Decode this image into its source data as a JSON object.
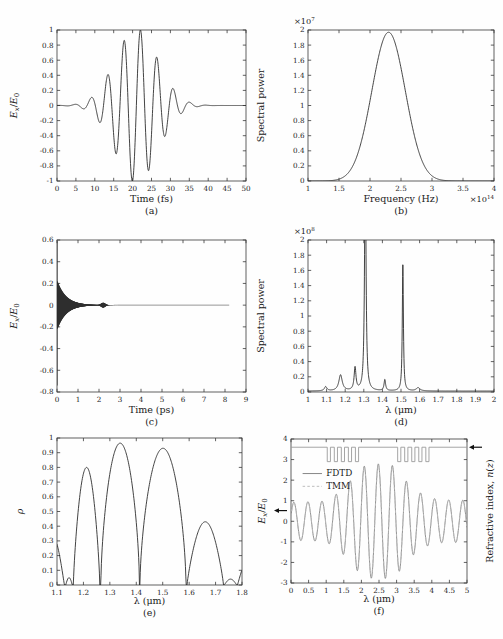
{
  "figure": {
    "background": "#fefefe"
  },
  "style": {
    "frame_color": "#3a3a3a",
    "text_color": "#1a1a1a",
    "curve_color": "#2e2e2e",
    "fdtd_color": "#878787",
    "tmm_color": "#bcbcbc",
    "index_color": "#9b9b9b",
    "arrow_color": "#111111"
  },
  "chart_data": [
    {
      "id": "a",
      "type": "line",
      "caption": "(a)",
      "xlabel": "Time (fs)",
      "ylabel_rich": [
        {
          "t": "E",
          "i": true
        },
        {
          "t": "x",
          "i": true,
          "sub": true
        },
        {
          "t": "/"
        },
        {
          "t": "E",
          "i": true
        },
        {
          "t": "0",
          "sub": true
        }
      ],
      "xlim": [
        0,
        50
      ],
      "ylim": [
        -1,
        1
      ],
      "xticks": [
        0,
        5,
        10,
        15,
        20,
        25,
        30,
        35,
        40,
        45,
        50
      ],
      "xtick_labels": [
        "0",
        "5",
        "10",
        "15",
        "20",
        "25",
        "30",
        "35",
        "40",
        "45",
        "50"
      ],
      "yticks": [
        -1,
        -0.8,
        -0.6,
        -0.4,
        -0.2,
        0,
        0.2,
        0.4,
        0.6,
        0.8,
        1
      ],
      "ytick_labels": [
        "-1",
        "-0.8",
        "-0.6",
        "-0.4",
        "-0.2",
        "0",
        "0.2",
        "0.4",
        "0.6",
        "0.8",
        "1"
      ],
      "layout": {
        "ml": 57,
        "mr": 5,
        "mt": 30,
        "ph": 151,
        "ylabel_dx": -40,
        "xlabel_dy": 21,
        "caption_dy": 33
      },
      "series": [
        {
          "name": "pulse",
          "model": "gabor",
          "amp": 1.02,
          "center": 21,
          "sigma": 5.6,
          "freq": 0.23,
          "phase": 0,
          "range": [
            0,
            50
          ],
          "step": 0.05,
          "color": "curve_color",
          "width": 0.9
        }
      ],
      "notable_points": {
        "max": {
          "t_fs": 22,
          "value": 0.98
        },
        "min": {
          "t_fs": 20,
          "value": -1.0
        },
        "pulse_center_fs": 21
      }
    },
    {
      "id": "b",
      "type": "line",
      "caption": "(b)",
      "xlabel": "Frequency (Hz)",
      "ylabel": "Spectral power",
      "y_exp_label": {
        "base": "×10",
        "exp": "7"
      },
      "x_exp_label": {
        "base": "×10",
        "exp": "14"
      },
      "xlim": [
        1,
        4
      ],
      "ylim": [
        0,
        2
      ],
      "xticks": [
        1,
        1.5,
        2,
        2.5,
        3,
        3.5,
        4
      ],
      "xtick_labels": [
        "1",
        "1.5",
        "2",
        "2.5",
        "3",
        "3.5",
        "4"
      ],
      "yticks": [
        0,
        0.2,
        0.4,
        0.6,
        0.8,
        1,
        1.2,
        1.4,
        1.6,
        1.8,
        2
      ],
      "ytick_labels": [
        "0",
        "0.2",
        "0.4",
        "0.6",
        "0.8",
        "1",
        "1.2",
        "1.4",
        "1.6",
        "1.8",
        "2"
      ],
      "layout": {
        "ml": 57,
        "mr": 9,
        "mt": 30,
        "ph": 151,
        "ylabel_dx": -44,
        "xlabel_dy": 21,
        "caption_dy": 33
      },
      "series": [
        {
          "name": "spectrum",
          "model": "gaussian",
          "amp": 1.97,
          "center": 2.3,
          "sigma": 0.27,
          "range": [
            1,
            4
          ],
          "step": 0.005,
          "color": "curve_color",
          "width": 0.9
        }
      ],
      "notable_points": {
        "peak": {
          "frequency_e14_Hz": 2.3,
          "spectral_power_e7": 1.97
        }
      }
    },
    {
      "id": "c",
      "type": "line",
      "caption": "(c)",
      "xlabel": "Time (ps)",
      "ylabel_rich": [
        {
          "t": "E",
          "i": true
        },
        {
          "t": "x",
          "i": true,
          "sub": true
        },
        {
          "t": "/"
        },
        {
          "t": "E",
          "i": true
        },
        {
          "t": "0",
          "sub": true
        }
      ],
      "xlim": [
        0,
        9
      ],
      "ylim": [
        -0.8,
        0.6
      ],
      "xticks": [
        0,
        1,
        2,
        3,
        4,
        5,
        6,
        7,
        8,
        9
      ],
      "xtick_labels": [
        "0",
        "1",
        "2",
        "3",
        "4",
        "5",
        "6",
        "7",
        "8",
        "9"
      ],
      "yticks": [
        -0.8,
        -0.6,
        -0.4,
        -0.2,
        0,
        0.2,
        0.4,
        0.6
      ],
      "ytick_labels": [
        "-0.8",
        "-0.6",
        "-0.4",
        "-0.2",
        "0",
        "0.2",
        "0.4",
        "0.6"
      ],
      "layout": {
        "ml": 57,
        "mr": 5,
        "mt": 27,
        "ph": 152,
        "ylabel_dx": -40,
        "xlabel_dy": 21,
        "caption_dy": 33
      },
      "series": [
        {
          "name": "ringdown",
          "model": "decay_band",
          "intro": [
            [
              0,
              0
            ],
            [
              0.004,
              0.59
            ],
            [
              0.007,
              -0.74
            ]
          ],
          "t0": 0.01,
          "t1": 2.9,
          "dt": 0.004,
          "amp": 0.225,
          "tau": 0.42,
          "bump": {
            "t": 2.2,
            "a": 0.02,
            "w": 0.13
          },
          "flat_to": 8.2,
          "color": "curve_color",
          "width": 0.5
        }
      ],
      "notable_points": {
        "initial_spike_max": 0.59,
        "initial_spike_min": -0.74,
        "envelope_at_0.1ps": 0.2,
        "decayed_by_ps": 2.6,
        "trace_end_ps": 8.2
      }
    },
    {
      "id": "d",
      "type": "line",
      "caption": "(d)",
      "xlabel": "λ (μm)",
      "ylabel": "Spectral power",
      "y_exp_label": {
        "base": "×10",
        "exp": "8"
      },
      "xlim": [
        1,
        2
      ],
      "ylim": [
        0,
        2
      ],
      "xticks": [
        1,
        1.1,
        1.2,
        1.3,
        1.4,
        1.5,
        1.6,
        1.7,
        1.8,
        1.9,
        2
      ],
      "xtick_labels": [
        "1",
        "1.1",
        "1.2",
        "1.3",
        "1.4",
        "1.5",
        "1.6",
        "1.7",
        "1.8",
        "1.9",
        "2"
      ],
      "yticks": [
        0,
        0.2,
        0.4,
        0.6,
        0.8,
        1,
        1.2,
        1.4,
        1.6,
        1.8,
        2
      ],
      "ytick_labels": [
        "0",
        "0.2",
        "0.4",
        "0.6",
        "0.8",
        "1",
        "1.2",
        "1.4",
        "1.6",
        "1.8",
        "2"
      ],
      "layout": {
        "ml": 57,
        "mr": 9,
        "mt": 27,
        "ph": 152,
        "ylabel_dx": -44,
        "xlabel_dy": 21,
        "caption_dy": 33
      },
      "series": [
        {
          "name": "spectrum",
          "model": "lorentz_peaks",
          "base": 0.012,
          "range": [
            1,
            2
          ],
          "step": 0.0008,
          "peaks": [
            [
              1.095,
              0.055,
              0.008
            ],
            [
              1.175,
              0.21,
              0.011
            ],
            [
              1.253,
              0.3,
              0.006
            ],
            [
              1.308,
              3.2,
              0.0045
            ],
            [
              1.413,
              0.145,
              0.005
            ],
            [
              1.51,
              1.68,
              0.0035
            ],
            [
              1.592,
              0.042,
              0.012
            ]
          ],
          "color": "curve_color",
          "width": 0.9
        }
      ],
      "notable_points": {
        "main_peak": {
          "lambda_um": 1.31,
          "clipped_at_e8": 2.0
        },
        "second_peak": {
          "lambda_um": 1.51,
          "value_e8": 1.68
        },
        "minor_peaks_um": [
          1.1,
          1.18,
          1.25,
          1.41,
          1.59
        ]
      }
    },
    {
      "id": "e",
      "type": "line",
      "caption": "(e)",
      "xlabel": "λ (μm)",
      "ylabel_rich": [
        {
          "t": "ρ",
          "i": true
        }
      ],
      "xlim": [
        1.1,
        1.8
      ],
      "ylim": [
        0,
        1
      ],
      "xticks": [
        1.1,
        1.2,
        1.3,
        1.4,
        1.5,
        1.6,
        1.7,
        1.8
      ],
      "xtick_labels": [
        "1.1",
        "1.2",
        "1.3",
        "1.4",
        "1.5",
        "1.6",
        "1.7",
        "1.8"
      ],
      "yticks": [
        0,
        0.1,
        0.2,
        0.3,
        0.4,
        0.5,
        0.6,
        0.7,
        0.8,
        0.9,
        1
      ],
      "ytick_labels": [
        "0",
        "0.1",
        "0.2",
        "0.3",
        "0.4",
        "0.5",
        "0.6",
        "0.7",
        "0.8",
        "0.9",
        "1"
      ],
      "layout": {
        "ml": 57,
        "mr": 9,
        "mt": 12,
        "ph": 147,
        "ylabel_dx": -34,
        "xlabel_dy": 19,
        "caption_dy": 31
      },
      "series": [
        {
          "name": "reflectance",
          "model": "lobes",
          "range": [
            1.1,
            1.8
          ],
          "step": 0.0015,
          "lobes": [
            [
              1.04,
              1.128,
              0.33,
              1
            ],
            [
              1.133,
              1.158,
              0.05,
              1
            ],
            [
              1.162,
              1.262,
              0.8,
              0.75
            ],
            [
              1.266,
              1.412,
              0.965,
              0.6
            ],
            [
              1.414,
              1.588,
              0.93,
              0.6
            ],
            [
              1.592,
              1.73,
              0.43,
              0.85
            ],
            [
              1.733,
              1.78,
              0.04,
              1
            ],
            [
              1.783,
              1.87,
              0.18,
              1
            ]
          ],
          "color": "curve_color",
          "width": 0.9
        }
      ],
      "notable_points": {
        "lobe_peaks": [
          {
            "lambda_um": 1.22,
            "rho": 0.8
          },
          {
            "lambda_um": 1.34,
            "rho": 0.965
          },
          {
            "lambda_um": 1.48,
            "rho": 0.93
          },
          {
            "lambda_um": 1.64,
            "rho": 0.43
          }
        ],
        "zeros_um": [
          1.13,
          1.16,
          1.26,
          1.41,
          1.59,
          1.73,
          1.78
        ]
      }
    },
    {
      "id": "f",
      "type": "line",
      "caption": "(f)",
      "xlabel": "λ (μm)",
      "ylabel_rich": [
        {
          "t": "E",
          "i": true
        },
        {
          "t": "x",
          "i": true,
          "sub": true
        },
        {
          "t": "/"
        },
        {
          "t": "E",
          "i": true
        },
        {
          "t": "0",
          "sub": true
        }
      ],
      "ylabel_right_rich": [
        {
          "t": "Refractive index, "
        },
        {
          "t": "n",
          "i": true
        },
        {
          "t": "("
        },
        {
          "t": "z",
          "i": true
        },
        {
          "t": ")"
        }
      ],
      "xlim": [
        0,
        5
      ],
      "ylim": [
        -3,
        4
      ],
      "xticks": [
        0,
        0.5,
        1,
        1.5,
        2,
        2.5,
        3,
        3.5,
        4,
        4.5,
        5
      ],
      "xtick_labels": [
        "0",
        "0.5",
        "1",
        "1.5",
        "2",
        "2.5",
        "3",
        "3.5",
        "4",
        "4.5",
        "5"
      ],
      "yticks": [
        -3,
        -2,
        -1,
        0,
        1,
        2,
        3,
        4
      ],
      "ytick_labels": [
        "-3",
        "-2",
        "-1",
        "0",
        "1",
        "2",
        "3",
        "4"
      ],
      "layout": {
        "ml": 40,
        "mr": 36,
        "mt": 13,
        "ph": 144,
        "ylabel_dx": -26,
        "ylabel_right_dx": 26,
        "xlabel_dy": 19,
        "caption_dy": 31
      },
      "legend": {
        "x1": 0.33,
        "x2": 0.88,
        "tx": 1.0,
        "items": [
          {
            "label": "FDTD",
            "y": 2.32,
            "color": "fdtd_color",
            "dash": null
          },
          {
            "label": "TMM",
            "y": 1.7,
            "color": "tmm_color",
            "dash": "2.5,2.2"
          }
        ]
      },
      "annotations": [
        {
          "type": "arrow",
          "side": "left",
          "y": 0.52
        },
        {
          "type": "arrow",
          "side": "right",
          "y": 3.6
        }
      ],
      "series": [
        {
          "name": "FDTD field",
          "model": "env_osc",
          "period": 0.4,
          "phase": 0.3,
          "scale": 1,
          "range": [
            0,
            5
          ],
          "step": 0.008,
          "envelope": [
            [
              0,
              0.92
            ],
            [
              0.95,
              0.98
            ],
            [
              1.2,
              1.2
            ],
            [
              1.45,
              1.55
            ],
            [
              1.7,
              2.0
            ],
            [
              1.95,
              2.55
            ],
            [
              2.15,
              2.75
            ],
            [
              2.55,
              2.8
            ],
            [
              2.85,
              2.75
            ],
            [
              3.05,
              2.5
            ],
            [
              3.3,
              1.9
            ],
            [
              3.6,
              1.45
            ],
            [
              3.9,
              1.18
            ],
            [
              4.2,
              1.05
            ],
            [
              5,
              1.02
            ]
          ],
          "color": "fdtd_color",
          "width": 0.9
        },
        {
          "name": "TMM field",
          "model": "env_osc",
          "period": 0.4,
          "phase": 0.3,
          "scale": 0.97,
          "range": [
            0,
            5
          ],
          "step": 0.008,
          "envelope": [
            [
              0,
              0.92
            ],
            [
              0.95,
              0.98
            ],
            [
              1.2,
              1.2
            ],
            [
              1.45,
              1.55
            ],
            [
              1.7,
              2.0
            ],
            [
              1.95,
              2.55
            ],
            [
              2.15,
              2.75
            ],
            [
              2.55,
              2.8
            ],
            [
              2.85,
              2.75
            ],
            [
              3.05,
              2.5
            ],
            [
              3.3,
              1.9
            ],
            [
              3.6,
              1.45
            ],
            [
              3.9,
              1.18
            ],
            [
              4.2,
              1.05
            ],
            [
              5,
              1.02
            ]
          ],
          "color": "tmm_color",
          "width": 0.9,
          "dash": "2.5,2.2"
        },
        {
          "name": "refractive index profile",
          "model": "steps",
          "high": 3.6,
          "low": 2.9,
          "range": [
            0,
            5
          ],
          "wells": [
            [
              1.03,
              1.12
            ],
            [
              1.23,
              1.32
            ],
            [
              1.43,
              1.52
            ],
            [
              1.63,
              1.72
            ],
            [
              1.83,
              1.92
            ],
            [
              3.03,
              3.12
            ],
            [
              3.23,
              3.32
            ],
            [
              3.43,
              3.52
            ],
            [
              3.63,
              3.72
            ],
            [
              3.83,
              3.92
            ]
          ],
          "color": "index_color",
          "width": 0.9
        }
      ],
      "notable_points": {
        "n_high": 3.6,
        "n_low": 2.9,
        "grating_regions_um": [
          [
            1.0,
            1.95
          ],
          [
            3.0,
            3.95
          ]
        ],
        "cavity_um": [
          2.0,
          3.0
        ],
        "field_peak_in_cavity": 2.8,
        "field_amp_outside": 1.0
      }
    }
  ]
}
